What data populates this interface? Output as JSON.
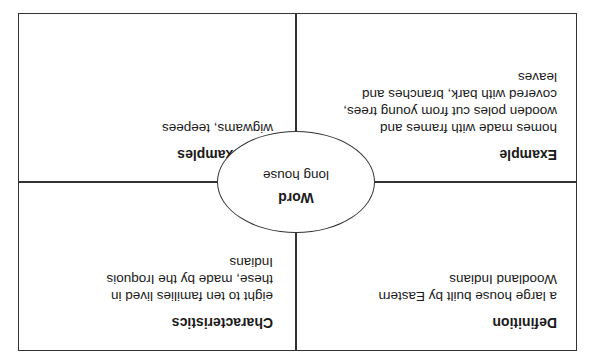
{
  "diagram": {
    "type": "Frayer model",
    "orientation": "rotated 180 degrees",
    "center": {
      "title": "Word",
      "text": "long house"
    },
    "quadrants": {
      "definition": {
        "title": "Definition",
        "text": "a large house built by Eastern Woodland Indians"
      },
      "characteristics": {
        "title": "Characteristics",
        "text": "eight to ten families lived in these, made by the Iroquois Indians"
      },
      "example": {
        "title": "Example",
        "text": "homes made with frames and wooden poles cut from young trees, covered with bark, branches and leaves"
      },
      "non_examples": {
        "title": "Non-examples",
        "text": "wigwams, teepees"
      }
    },
    "colors": {
      "line": "#333333",
      "text": "#1a1a1a",
      "background": "#ffffff"
    }
  }
}
